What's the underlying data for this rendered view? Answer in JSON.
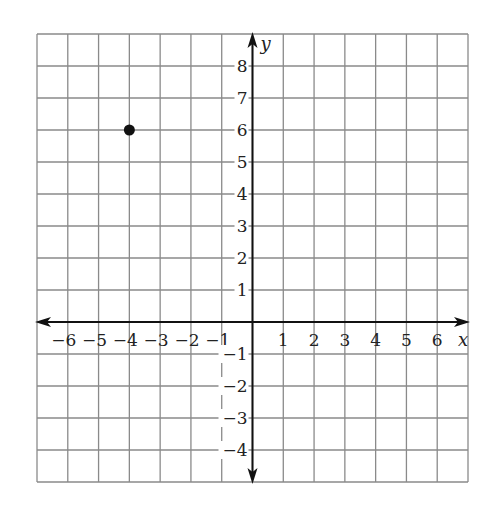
{
  "chart_data": {
    "type": "scatter",
    "title": "",
    "xlabel": "x",
    "ylabel": "y",
    "xlim": [
      -7,
      7
    ],
    "ylim": [
      -5,
      9
    ],
    "grid": true,
    "x_ticks": [
      -6,
      -5,
      -4,
      -3,
      -2,
      -1,
      1,
      2,
      3,
      4,
      5,
      6
    ],
    "y_ticks": [
      8,
      7,
      6,
      5,
      4,
      3,
      2,
      1,
      -1,
      -2,
      -3,
      -4
    ],
    "x_tick_labels": [
      "−6",
      "−5",
      "−4",
      "−3",
      "−2",
      "−1",
      "1",
      "2",
      "3",
      "4",
      "5",
      "6"
    ],
    "y_tick_labels": [
      "8",
      "7",
      "6",
      "5",
      "4",
      "3",
      "2",
      "1",
      "−1",
      "−2",
      "−3",
      "−4"
    ],
    "points": [
      {
        "x": -4,
        "y": 6
      }
    ],
    "colors": {
      "grid": "#8a8a8a",
      "axis": "#111111",
      "point": "#111111"
    }
  }
}
